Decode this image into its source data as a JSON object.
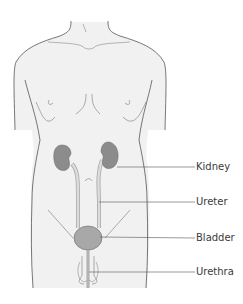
{
  "diagram": {
    "colors": {
      "body_fill": "#f1f1f1",
      "outline": "#555555",
      "organ_fill": "#8c8c8c",
      "bladder_fill": "#a8a8a8",
      "tube_fill": "#dcdcdc",
      "leader_line": "#555555",
      "label_text": "#3a3a3a"
    },
    "labels": [
      {
        "id": "kidney",
        "text": "Kidney",
        "y": 161
      },
      {
        "id": "ureter",
        "text": "Ureter",
        "y": 196
      },
      {
        "id": "bladder",
        "text": "Bladder",
        "y": 232
      },
      {
        "id": "urethra",
        "text": "Urethra",
        "y": 266
      }
    ]
  }
}
